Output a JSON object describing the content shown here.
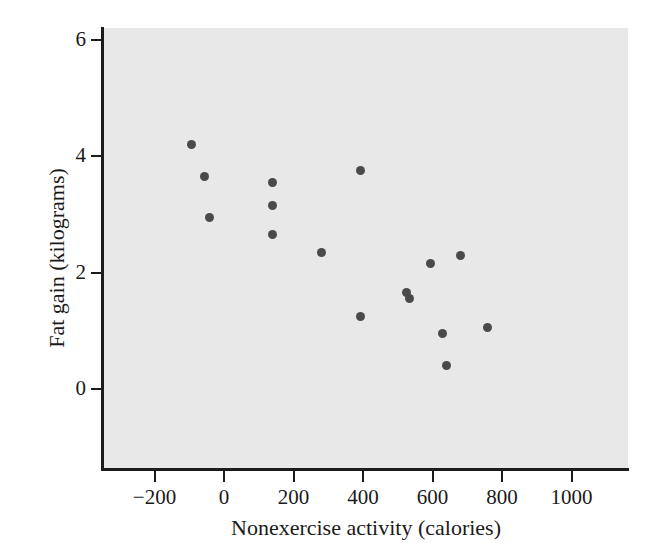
{
  "chart_data": {
    "type": "scatter",
    "title": "",
    "xlabel": "Nonexercise activity (calories)",
    "ylabel": "Fat gain (kilograms)",
    "xlim": [
      -350,
      1030
    ],
    "ylim": [
      -1.1,
      6.4
    ],
    "xticks": [
      -200,
      0,
      200,
      400,
      600,
      800,
      1000
    ],
    "xticklabels": [
      "-200",
      "0",
      "200",
      "400",
      "600",
      "800",
      "1000"
    ],
    "yticks": [
      0,
      2,
      4,
      6
    ],
    "yticklabels": [
      "0",
      "2",
      "4",
      "6"
    ],
    "grid": false,
    "legend": null,
    "marker": "circle",
    "marker_color": "#4a4a4a",
    "panel_color": "#e8e8e8",
    "axis_color": "#1c1c1c",
    "x": [
      -94,
      -57,
      140,
      -43,
      140,
      140,
      392,
      282,
      593,
      682,
      524,
      535,
      394,
      630,
      757,
      639
    ],
    "y": [
      4.2,
      3.65,
      3.55,
      2.95,
      3.15,
      2.65,
      3.75,
      2.35,
      2.15,
      2.3,
      1.65,
      1.55,
      1.25,
      0.95,
      1.05,
      0.4
    ],
    "points": [
      {
        "x": -94,
        "y": 4.2
      },
      {
        "x": -57,
        "y": 3.65
      },
      {
        "x": 140,
        "y": 3.55
      },
      {
        "x": -43,
        "y": 2.95
      },
      {
        "x": 140,
        "y": 3.15
      },
      {
        "x": 140,
        "y": 2.65
      },
      {
        "x": 392,
        "y": 3.75
      },
      {
        "x": 282,
        "y": 2.35
      },
      {
        "x": 593,
        "y": 2.15
      },
      {
        "x": 682,
        "y": 2.3
      },
      {
        "x": 524,
        "y": 1.65
      },
      {
        "x": 535,
        "y": 1.55
      },
      {
        "x": 394,
        "y": 1.25
      },
      {
        "x": 630,
        "y": 0.95
      },
      {
        "x": 757,
        "y": 1.05
      },
      {
        "x": 639,
        "y": 0.4
      }
    ]
  }
}
